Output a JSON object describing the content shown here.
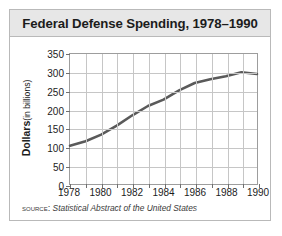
{
  "figure": {
    "title": "Federal Defense Spending, 1978–1990",
    "source_label": "SOURCE:",
    "source_text": "Statistical Abstract of the United States",
    "border_color": "#b9b9b9",
    "title_band_color": "#e7e7e7"
  },
  "axis": {
    "ylabel_main": "Dollars",
    "ylabel_sub": "(in billions)",
    "ytick_labels": [
      "350",
      "300",
      "250",
      "200",
      "150",
      "100",
      "50",
      "0"
    ],
    "xtick_labels": [
      "1978",
      "1980",
      "1982",
      "1984",
      "1986",
      "1988",
      "1990"
    ]
  },
  "chart_data": {
    "type": "line",
    "title": "Federal Defense Spending, 1978–1990",
    "xlabel": "",
    "ylabel": "Dollars (in billions)",
    "x": [
      1978,
      1979,
      1980,
      1981,
      1982,
      1983,
      1984,
      1985,
      1986,
      1987,
      1988,
      1989,
      1990
    ],
    "values": [
      103,
      115,
      133,
      157,
      185,
      210,
      227,
      252,
      272,
      282,
      290,
      301,
      296
    ],
    "series": [
      {
        "name": "Federal defense spending",
        "values": [
          103,
          115,
          133,
          157,
          185,
          210,
          227,
          252,
          272,
          282,
          290,
          301,
          296
        ]
      }
    ],
    "xlim": [
      1978,
      1990
    ],
    "ylim": [
      0,
      350
    ],
    "ytick_values": [
      0,
      50,
      100,
      150,
      200,
      250,
      300,
      350
    ],
    "xtick_values": [
      1978,
      1980,
      1982,
      1984,
      1986,
      1988,
      1990
    ],
    "xtick_minor_values": [
      1979,
      1981,
      1983,
      1985,
      1987,
      1989
    ],
    "grid": true,
    "legend": "none",
    "line_color": "#5a5a5a",
    "line_width": 2.6,
    "grid_color": "#c6c6c6",
    "axis_color": "#9d9d9d",
    "annotations": []
  }
}
